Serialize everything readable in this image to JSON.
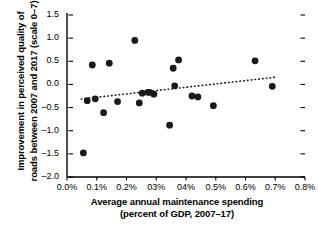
{
  "chart_data": {
    "type": "scatter",
    "title": "",
    "xlabel": "Average annual maintenance spending (percent of GDP, 2007–17)",
    "xlabel_line1": "Average annual maintenance spending",
    "xlabel_line2": "(percent of GDP, 2007–17)",
    "ylabel": "Improvement in perceived quality of roads between 2007 and 2017 (scale 0–7)",
    "ylabel_line1": "Improvement in perceived quality of",
    "ylabel_line2": "roads between 2007 and 2017 (scale 0–7)",
    "xlim": [
      0.0,
      0.8
    ],
    "ylim": [
      -2.0,
      1.5
    ],
    "xticks": [
      0.0,
      0.1,
      0.2,
      0.3,
      0.4,
      0.5,
      0.6,
      0.7,
      0.8
    ],
    "xtick_labels": [
      "0.0%",
      "0.1%",
      "0.2%",
      "03%",
      "04%",
      "0.5%",
      "0.6%",
      "0.7%",
      "0.8%"
    ],
    "yticks": [
      1.5,
      1.0,
      0.5,
      0.0,
      -0.5,
      -1.0,
      -1.5,
      -2.0
    ],
    "ytick_labels": [
      "1.5",
      "1.0",
      "0.5",
      "0.0",
      "–0.5",
      "–1.0",
      "–1.5",
      "–2.0"
    ],
    "grid": false,
    "legend": false,
    "marker_color": "#1a1a1a",
    "marker_size": 3.4,
    "axis_color": "#000000",
    "right_ticks": true,
    "x": [
      0.055,
      0.068,
      0.085,
      0.095,
      0.123,
      0.142,
      0.17,
      0.228,
      0.243,
      0.253,
      0.272,
      0.278,
      0.292,
      0.345,
      0.357,
      0.362,
      0.375,
      0.42,
      0.44,
      0.492,
      0.632,
      0.69
    ],
    "y": [
      -1.48,
      -0.35,
      0.42,
      -0.31,
      -0.61,
      0.46,
      -0.37,
      0.95,
      -0.4,
      -0.19,
      -0.17,
      -0.17,
      -0.21,
      -0.88,
      0.35,
      -0.03,
      0.53,
      -0.25,
      -0.27,
      -0.46,
      0.51,
      -0.04
    ],
    "points": [
      {
        "x": 0.055,
        "y": -1.48
      },
      {
        "x": 0.068,
        "y": -0.35
      },
      {
        "x": 0.085,
        "y": 0.42
      },
      {
        "x": 0.095,
        "y": -0.31
      },
      {
        "x": 0.123,
        "y": -0.61
      },
      {
        "x": 0.142,
        "y": 0.46
      },
      {
        "x": 0.17,
        "y": -0.37
      },
      {
        "x": 0.228,
        "y": 0.95
      },
      {
        "x": 0.243,
        "y": -0.4
      },
      {
        "x": 0.253,
        "y": -0.19
      },
      {
        "x": 0.272,
        "y": -0.17
      },
      {
        "x": 0.278,
        "y": -0.17
      },
      {
        "x": 0.292,
        "y": -0.21
      },
      {
        "x": 0.345,
        "y": -0.88
      },
      {
        "x": 0.357,
        "y": 0.35
      },
      {
        "x": 0.362,
        "y": -0.03
      },
      {
        "x": 0.375,
        "y": 0.53
      },
      {
        "x": 0.42,
        "y": -0.25
      },
      {
        "x": 0.44,
        "y": -0.27
      },
      {
        "x": 0.492,
        "y": -0.46
      },
      {
        "x": 0.632,
        "y": 0.51
      },
      {
        "x": 0.69,
        "y": -0.04
      }
    ],
    "trendline": {
      "style": "dotted",
      "color": "#1a1a1a",
      "x_start": 0.048,
      "y_start": -0.315,
      "x_end": 0.7,
      "y_end": 0.155
    }
  }
}
